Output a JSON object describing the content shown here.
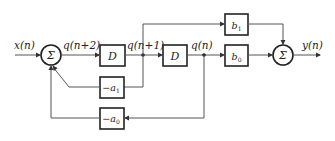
{
  "diagram": {
    "type": "signal-flow block diagram (direct form II biquad-like, second-order)",
    "signals": {
      "input": "x(n)",
      "q_n_plus_2": "q(n+2)",
      "q_n_plus_1": "q(n+1)",
      "q_n": "q(n)",
      "output": "y(n)"
    },
    "summers": {
      "input_sum": "Σ",
      "output_sum": "Σ"
    },
    "blocks": {
      "delay_1": "D",
      "delay_2": "D",
      "gain_b1_base": "b",
      "gain_b1_sub": "1",
      "gain_b0_base": "b",
      "gain_b0_sub": "0",
      "gain_a1_prefix": "−a",
      "gain_a1_sub": "1",
      "gain_a0_prefix": "−a",
      "gain_a0_sub": "0"
    },
    "connections": [
      {
        "from": "x(n)",
        "to": "input-sum"
      },
      {
        "from": "input-sum",
        "to": "delay-1",
        "signal": "q(n+2)"
      },
      {
        "from": "delay-1",
        "to": "delay-2",
        "signal": "q(n+1)"
      },
      {
        "from": "q(n+1)",
        "to": "gain-b1"
      },
      {
        "from": "q(n+1)",
        "to": "gain-minus-a1"
      },
      {
        "from": "gain-minus-a1",
        "to": "input-sum"
      },
      {
        "from": "delay-2",
        "to": "gain-b0",
        "signal": "q(n)"
      },
      {
        "from": "q(n)",
        "to": "gain-minus-a0"
      },
      {
        "from": "gain-minus-a0",
        "to": "input-sum"
      },
      {
        "from": "gain-b1",
        "to": "output-sum"
      },
      {
        "from": "gain-b0",
        "to": "output-sum"
      },
      {
        "from": "output-sum",
        "to": "y(n)"
      }
    ]
  },
  "colors": {
    "line": "#555555",
    "stroke": "#222222",
    "background": "#ffffff"
  }
}
